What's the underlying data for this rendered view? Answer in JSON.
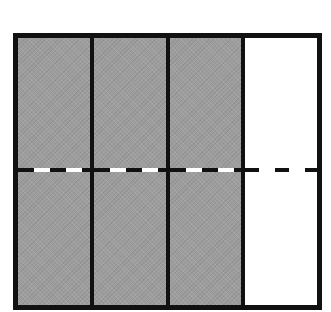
{
  "diagram": {
    "type": "fraction-area-model",
    "columns": 4,
    "rows": 2,
    "shaded_columns": 3,
    "columns_state": [
      {
        "index": 0,
        "shaded": true
      },
      {
        "index": 1,
        "shaded": true
      },
      {
        "index": 2,
        "shaded": true
      },
      {
        "index": 3,
        "shaded": false
      }
    ],
    "horizontal_divider": "dashed",
    "colors": {
      "border": "#111111",
      "shaded_fill": "#9d9d9d",
      "unshaded_fill": "#ffffff"
    }
  }
}
